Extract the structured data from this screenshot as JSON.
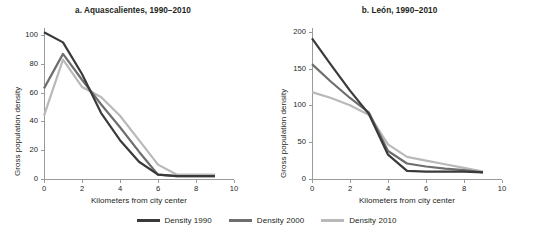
{
  "figure": {
    "cut_caption": "",
    "legend": {
      "items": [
        {
          "label": "Density 1990",
          "color": "#3a3a3a"
        },
        {
          "label": "Density 2000",
          "color": "#6e6e6e"
        },
        {
          "label": "Density 2010",
          "color": "#b9b9b9"
        }
      ]
    }
  },
  "chart_data": [
    {
      "type": "line",
      "panel": "a",
      "title": "a. Aquascalientes, 1990–2010",
      "xlabel": "Kilometers from city center",
      "ylabel": "Gross population density",
      "xlim": [
        0,
        10
      ],
      "ylim": [
        0,
        105
      ],
      "xticks": [
        0,
        2,
        4,
        6,
        8,
        10
      ],
      "xtick_labels": [
        "0",
        "2",
        "4",
        "6",
        "8",
        "10"
      ],
      "yticks": [
        0,
        20,
        40,
        60,
        80,
        100
      ],
      "ytick_labels": [
        "0",
        "20",
        "40",
        "60",
        "80",
        "100"
      ],
      "grid": false,
      "legend_position": "bottom-center-shared",
      "x": [
        0,
        1,
        2,
        3,
        4,
        5,
        6,
        7,
        8,
        9
      ],
      "series": [
        {
          "name": "Density 1990",
          "color": "#3a3a3a",
          "values": [
            102,
            95,
            73,
            46,
            27,
            12,
            3,
            2,
            2,
            2
          ]
        },
        {
          "name": "Density 2000",
          "color": "#6e6e6e",
          "values": [
            63,
            87,
            69,
            52,
            36,
            19,
            3,
            2,
            2,
            2
          ]
        },
        {
          "name": "Density 2010",
          "color": "#b9b9b9",
          "values": [
            44,
            83,
            64,
            57,
            44,
            27,
            10,
            3,
            3,
            3
          ]
        }
      ]
    },
    {
      "type": "line",
      "panel": "b",
      "title": "b. León, 1990–2010",
      "xlabel": "Kilometers from city center",
      "ylabel": "Gross population density",
      "xlim": [
        0,
        10
      ],
      "ylim": [
        0,
        205
      ],
      "xticks": [
        0,
        2,
        4,
        6,
        8,
        10
      ],
      "xtick_labels": [
        "0",
        "2",
        "4",
        "6",
        "8",
        "10"
      ],
      "yticks": [
        0,
        50,
        100,
        150,
        200
      ],
      "ytick_labels": [
        "0",
        "50",
        "100",
        "150",
        "200"
      ],
      "grid": false,
      "legend_position": "bottom-center-shared",
      "x": [
        0,
        1,
        2,
        3,
        4,
        5,
        6,
        7,
        8,
        9
      ],
      "series": [
        {
          "name": "Density 1990",
          "color": "#3a3a3a",
          "values": [
            191,
            155,
            120,
            88,
            33,
            11,
            10,
            10,
            10,
            9
          ]
        },
        {
          "name": "Density 2000",
          "color": "#6e6e6e",
          "values": [
            156,
            132,
            110,
            90,
            38,
            21,
            17,
            14,
            12,
            9
          ]
        },
        {
          "name": "Density 2010",
          "color": "#b9b9b9",
          "values": [
            118,
            110,
            100,
            87,
            47,
            30,
            25,
            20,
            15,
            10
          ]
        }
      ]
    }
  ]
}
